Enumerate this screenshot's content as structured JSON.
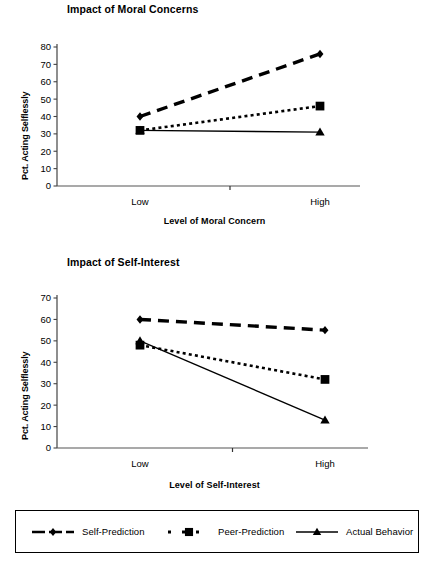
{
  "figure": {
    "background": "#ffffff",
    "ink": "#000000"
  },
  "legend": {
    "position": "bottom",
    "box_border": "#000000",
    "entries": [
      {
        "name": "Self-Prediction",
        "marker": "diamond",
        "dash": "long-dash",
        "key_icon": "legend-key-diamond-icon"
      },
      {
        "name": "Peer-Prediction",
        "marker": "square",
        "dash": "dotted",
        "key_icon": "legend-key-square-icon"
      },
      {
        "name": "Actual Behavior",
        "marker": "triangle",
        "dash": "solid",
        "key_icon": "legend-key-triangle-icon"
      }
    ]
  },
  "chart_data": [
    {
      "type": "line",
      "title": "Impact of Moral Concerns",
      "xlabel": "Level of Moral Concern",
      "ylabel": "Pct. Acting Selflessly",
      "categories": [
        "Low",
        "High"
      ],
      "x": [
        0,
        1
      ],
      "ylim": [
        0,
        80
      ],
      "yticks": [
        0,
        10,
        20,
        30,
        40,
        50,
        60,
        70,
        80
      ],
      "ytick_labels": [
        "0",
        "10",
        "20",
        "30",
        "40",
        "50",
        "60",
        "70",
        "80"
      ],
      "grid": false,
      "legend_position": "below-figure",
      "series": [
        {
          "name": "Self-Prediction",
          "marker": "diamond",
          "dash": "long-dash",
          "values": [
            40,
            76
          ]
        },
        {
          "name": "Peer-Prediction",
          "marker": "square",
          "dash": "dotted",
          "values": [
            32,
            46
          ]
        },
        {
          "name": "Actual Behavior",
          "marker": "triangle",
          "dash": "solid",
          "values": [
            32,
            31
          ]
        }
      ]
    },
    {
      "type": "line",
      "title": "Impact of Self-Interest",
      "xlabel": "Level of Self-Interest",
      "ylabel": "Pct. Acting Selflessly",
      "categories": [
        "Low",
        "High"
      ],
      "x": [
        0,
        1
      ],
      "ylim": [
        0,
        70
      ],
      "yticks": [
        0,
        10,
        20,
        30,
        40,
        50,
        60,
        70
      ],
      "ytick_labels": [
        "0",
        "10",
        "20",
        "30",
        "40",
        "50",
        "60",
        "70"
      ],
      "grid": false,
      "legend_position": "below-figure",
      "series": [
        {
          "name": "Self-Prediction",
          "marker": "diamond",
          "dash": "long-dash",
          "values": [
            60,
            55
          ]
        },
        {
          "name": "Peer-Prediction",
          "marker": "square",
          "dash": "dotted",
          "values": [
            48,
            32
          ]
        },
        {
          "name": "Actual Behavior",
          "marker": "triangle",
          "dash": "solid",
          "values": [
            50,
            13
          ]
        }
      ]
    }
  ]
}
